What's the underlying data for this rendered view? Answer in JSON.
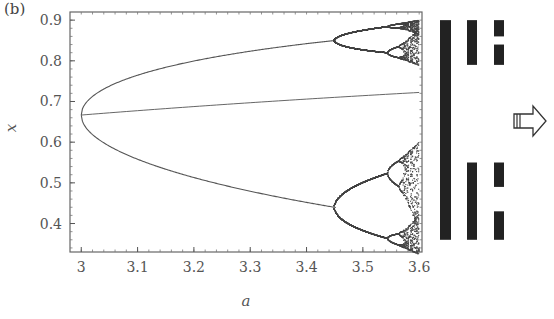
{
  "panel_label": "(b)",
  "chart_data": {
    "type": "line",
    "title": "",
    "xlabel": "a",
    "ylabel": "x",
    "xlim": [
      2.98,
      3.605
    ],
    "ylim": [
      0.33,
      0.92
    ],
    "xticks": [
      "3",
      "3.1",
      "3.2",
      "3.3",
      "3.4",
      "3.5",
      "3.6"
    ],
    "yticks": [
      "0.4",
      "0.5",
      "0.6",
      "0.7",
      "0.8",
      "0.9"
    ],
    "grid": false,
    "legend": null,
    "data_source_note": "Curve values are theoretical (logistic-map formulas), not digitized from the image; frame/tick pixel positions are approximate",
    "series": [
      {
        "name": "fixed point (unstable after a=3)",
        "x": [
          3.0,
          3.1,
          3.2,
          3.3,
          3.4,
          3.5,
          3.6
        ],
        "values": [
          0.667,
          0.677,
          0.688,
          0.697,
          0.706,
          0.714,
          0.722
        ]
      },
      {
        "name": "period-2 upper branch",
        "x": [
          3.0,
          3.05,
          3.1,
          3.2,
          3.3,
          3.4,
          3.449
        ],
        "values": [
          0.667,
          0.743,
          0.765,
          0.799,
          0.824,
          0.842,
          0.849
        ]
      },
      {
        "name": "period-2 lower branch",
        "x": [
          3.0,
          3.05,
          3.1,
          3.2,
          3.3,
          3.4,
          3.449
        ],
        "values": [
          0.667,
          0.585,
          0.558,
          0.513,
          0.48,
          0.452,
          0.44
        ]
      },
      {
        "name": "period-4 and chaotic region",
        "x": [
          3.449,
          3.5,
          3.544,
          3.57,
          3.6
        ],
        "values_range": [
          [
            0.35,
            0.9
          ]
        ]
      }
    ]
  },
  "symbolic_bars": {
    "description": "Black bars showing interval covering at successive levels",
    "columns": [
      {
        "level": 1,
        "segments": [
          [
            0.9,
            0.36
          ]
        ]
      },
      {
        "level": 2,
        "segments": [
          [
            0.9,
            0.79
          ],
          [
            0.55,
            0.36
          ]
        ]
      },
      {
        "level": 3,
        "segments": [
          [
            0.9,
            0.86
          ],
          [
            0.84,
            0.79
          ],
          [
            0.55,
            0.49
          ],
          [
            0.43,
            0.36
          ]
        ]
      }
    ]
  },
  "arrow": {
    "direction": "right",
    "icon": "hollow-right-arrow"
  }
}
